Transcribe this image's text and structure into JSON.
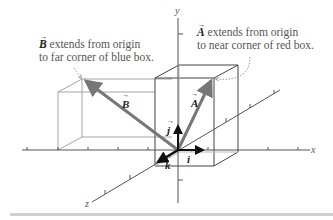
{
  "figure": {
    "annotations": {
      "b_caption": {
        "vector": "B",
        "line1_rest": " extends from origin",
        "line2": "to far corner of blue box."
      },
      "a_caption": {
        "vector": "A",
        "line1_rest": " extends from origin",
        "line2": "to near corner of red box."
      }
    },
    "vector_labels": {
      "A": "A",
      "B": "B",
      "i": "i",
      "j": "j",
      "k": "k"
    },
    "axes": {
      "x": "x",
      "y": "y",
      "z": "z"
    },
    "colors": {
      "box_near": "#444444",
      "box_far": "#9a9a9a",
      "vector_gray": "#777777",
      "unit_vector": "#111111",
      "axis": "#555555",
      "caption_text": "#555555",
      "dotted_leader": "#777777"
    }
  }
}
